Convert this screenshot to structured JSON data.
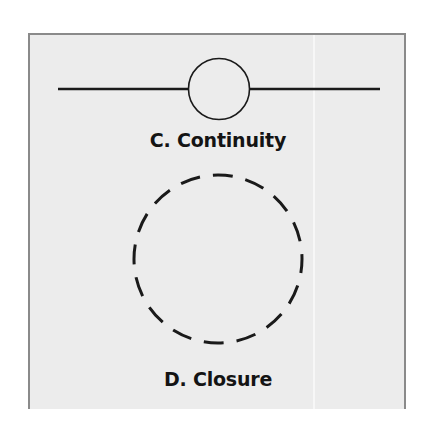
{
  "figure": {
    "panels": [
      {
        "id": "continuity",
        "label": "C. Continuity",
        "shape": "line-through-circle"
      },
      {
        "id": "closure",
        "label": "D. Closure",
        "shape": "dashed-circle"
      }
    ],
    "colors": {
      "background": "#ececec",
      "border": "#8a8a8a",
      "stroke": "#1a1a1a",
      "text": "#141414"
    }
  }
}
